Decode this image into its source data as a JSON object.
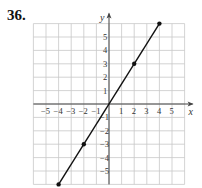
{
  "problem_number": "36.",
  "chart_data": {
    "type": "line",
    "title": "",
    "xlabel": "x",
    "ylabel": "y",
    "xlim": [
      -6,
      6
    ],
    "ylim": [
      -6,
      6
    ],
    "grid": true,
    "x_ticks": [
      -5,
      -4,
      -3,
      -2,
      -1,
      1,
      2,
      3,
      4,
      5
    ],
    "y_ticks": [
      -5,
      -4,
      -3,
      -2,
      -1,
      1,
      2,
      3,
      4,
      5
    ],
    "series": [
      {
        "name": "line",
        "x": [
          -4,
          -2,
          0,
          2,
          4
        ],
        "y": [
          -6,
          -3,
          0,
          3,
          6
        ],
        "marked_points": [
          [
            -4,
            -6
          ],
          [
            -2,
            -3
          ],
          [
            2,
            3
          ],
          [
            4,
            6
          ]
        ]
      }
    ],
    "colors": {
      "grid": "#c8c8c8",
      "axis": "#444444",
      "line": "#111111"
    }
  }
}
